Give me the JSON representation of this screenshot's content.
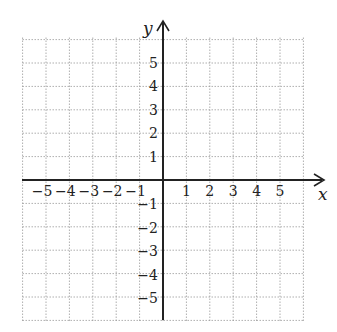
{
  "chart_data": {
    "type": "coordinate_grid",
    "title": "",
    "xlabel": "x",
    "ylabel": "y",
    "xlim": [
      -6,
      6
    ],
    "ylim": [
      -6,
      6
    ],
    "grid": true,
    "grid_style": "dotted",
    "x_ticks": [
      "−5",
      "−4",
      "−3",
      "−2",
      "−1",
      "1",
      "2",
      "3",
      "4",
      "5"
    ],
    "y_ticks": [
      "5",
      "4",
      "3",
      "2",
      "1",
      "−1",
      "−2",
      "−3",
      "−4",
      "−5"
    ],
    "x_tick_values": [
      -5,
      -4,
      -3,
      -2,
      -1,
      1,
      2,
      3,
      4,
      5
    ],
    "y_tick_values": [
      5,
      4,
      3,
      2,
      1,
      -1,
      -2,
      -3,
      -4,
      -5
    ]
  },
  "colors": {
    "axis": "#222222",
    "grid": "#9a9a9a",
    "background": "#ffffff"
  }
}
